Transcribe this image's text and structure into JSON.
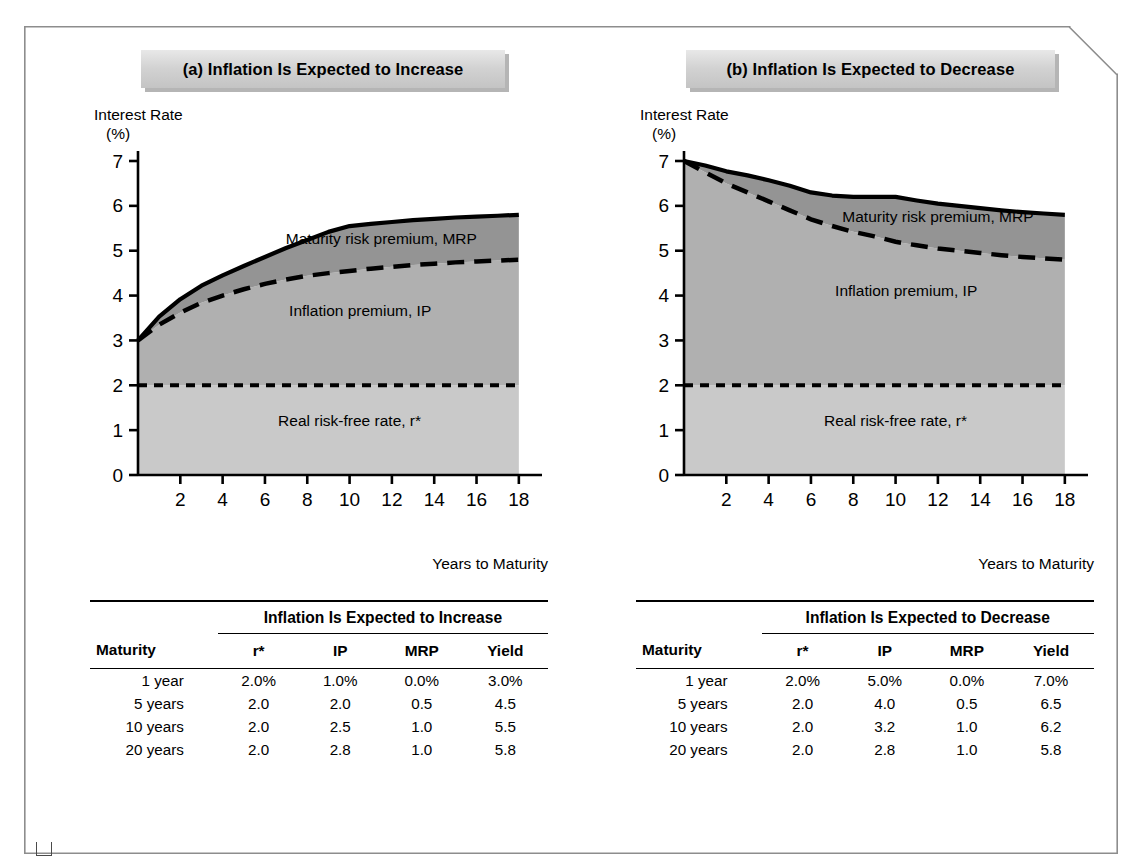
{
  "panels": [
    {
      "id": "a",
      "title": "(a) Inflation Is Expected to Increase",
      "y_axis_label": "Interest Rate",
      "y_axis_unit": "(%)",
      "x_axis_label": "Years to Maturity",
      "band_labels": {
        "mrp": "Maturity risk premium, MRP",
        "ip": "Inflation premium, IP",
        "rf": "Real risk-free rate, r*"
      },
      "table": {
        "group_header": "Inflation Is Expected to Increase",
        "columns": [
          "Maturity",
          "r*",
          "IP",
          "MRP",
          "Yield"
        ],
        "rows": [
          [
            "1 year",
            "2.0%",
            "1.0%",
            "0.0%",
            "3.0%"
          ],
          [
            "5 years",
            "2.0",
            "2.0",
            "0.5",
            "4.5"
          ],
          [
            "10 years",
            "2.0",
            "2.5",
            "1.0",
            "5.5"
          ],
          [
            "20 years",
            "2.0",
            "2.8",
            "1.0",
            "5.8"
          ]
        ]
      }
    },
    {
      "id": "b",
      "title": "(b) Inflation Is Expected to Decrease",
      "y_axis_label": "Interest Rate",
      "y_axis_unit": "(%)",
      "x_axis_label": "Years to Maturity",
      "band_labels": {
        "mrp": "Maturity risk premium, MRP",
        "ip": "Inflation premium, IP",
        "rf": "Real risk-free rate, r*"
      },
      "table": {
        "group_header": "Inflation Is Expected to Decrease",
        "columns": [
          "Maturity",
          "r*",
          "IP",
          "MRP",
          "Yield"
        ],
        "rows": [
          [
            "1 year",
            "2.0%",
            "5.0%",
            "0.0%",
            "7.0%"
          ],
          [
            "5 years",
            "2.0",
            "4.0",
            "0.5",
            "6.5"
          ],
          [
            "10 years",
            "2.0",
            "3.2",
            "1.0",
            "6.2"
          ],
          [
            "20 years",
            "2.0",
            "2.8",
            "1.0",
            "5.8"
          ]
        ]
      }
    }
  ],
  "colors": {
    "band_riskfree": "#c9c9c9",
    "band_inflation": "#b0b0b0",
    "band_mrp": "#949494",
    "axis": "#000000",
    "frame_border": "#8d8d8d",
    "title_box": "#d2d2d2"
  },
  "chart_data": [
    {
      "type": "area",
      "title": "(a) Inflation Is Expected to Increase",
      "xlabel": "Years to Maturity",
      "ylabel": "Interest Rate (%)",
      "xlim": [
        0,
        19
      ],
      "ylim": [
        0,
        7
      ],
      "xticks": [
        2,
        4,
        6,
        8,
        10,
        12,
        14,
        16,
        18
      ],
      "yticks": [
        0,
        1,
        2,
        3,
        4,
        5,
        6,
        7
      ],
      "grid": false,
      "stacked": true,
      "x": [
        0,
        1,
        2,
        3,
        4,
        5,
        6,
        7,
        8,
        9,
        10,
        11,
        12,
        13,
        14,
        15,
        16,
        17,
        18
      ],
      "series": [
        {
          "name": "Real risk-free rate, r*",
          "values": [
            2.0,
            2.0,
            2.0,
            2.0,
            2.0,
            2.0,
            2.0,
            2.0,
            2.0,
            2.0,
            2.0,
            2.0,
            2.0,
            2.0,
            2.0,
            2.0,
            2.0,
            2.0,
            2.0
          ]
        },
        {
          "name": "Inflation premium, IP",
          "values": [
            1.0,
            1.35,
            1.62,
            1.84,
            2.0,
            2.14,
            2.26,
            2.36,
            2.44,
            2.5,
            2.55,
            2.6,
            2.64,
            2.68,
            2.71,
            2.74,
            2.76,
            2.78,
            2.8
          ]
        },
        {
          "name": "Maturity risk premium, MRP",
          "values": [
            0.0,
            0.18,
            0.3,
            0.38,
            0.45,
            0.52,
            0.6,
            0.7,
            0.8,
            0.92,
            1.0,
            1.0,
            1.0,
            1.0,
            1.0,
            1.0,
            1.0,
            1.0,
            1.0
          ]
        }
      ],
      "yield_curve": {
        "name": "Yield",
        "values": [
          3.0,
          3.53,
          3.92,
          4.22,
          4.45,
          4.66,
          4.86,
          5.06,
          5.24,
          5.42,
          5.55,
          5.6,
          5.64,
          5.68,
          5.71,
          5.74,
          5.76,
          5.78,
          5.8
        ]
      },
      "annotations": [
        {
          "text": "Maturity risk premium, MRP",
          "x": 11.5,
          "y": 5.15
        },
        {
          "text": "Inflation premium, IP",
          "x": 10.5,
          "y": 3.55
        },
        {
          "text": "Real risk-free rate, r*",
          "x": 10.0,
          "y": 1.1
        }
      ]
    },
    {
      "type": "area",
      "title": "(b) Inflation Is Expected to Decrease",
      "xlabel": "Years to Maturity",
      "ylabel": "Interest Rate (%)",
      "xlim": [
        0,
        19
      ],
      "ylim": [
        0,
        7
      ],
      "xticks": [
        2,
        4,
        6,
        8,
        10,
        12,
        14,
        16,
        18
      ],
      "yticks": [
        0,
        1,
        2,
        3,
        4,
        5,
        6,
        7
      ],
      "grid": false,
      "stacked": true,
      "x": [
        0,
        1,
        2,
        3,
        4,
        5,
        6,
        7,
        8,
        9,
        10,
        11,
        12,
        13,
        14,
        15,
        16,
        17,
        18
      ],
      "series": [
        {
          "name": "Real risk-free rate, r*",
          "values": [
            2.0,
            2.0,
            2.0,
            2.0,
            2.0,
            2.0,
            2.0,
            2.0,
            2.0,
            2.0,
            2.0,
            2.0,
            2.0,
            2.0,
            2.0,
            2.0,
            2.0,
            2.0,
            2.0
          ]
        },
        {
          "name": "Inflation premium, IP",
          "values": [
            5.0,
            4.75,
            4.5,
            4.3,
            4.1,
            3.9,
            3.7,
            3.55,
            3.42,
            3.32,
            3.2,
            3.12,
            3.05,
            3.0,
            2.95,
            2.9,
            2.86,
            2.83,
            2.8
          ]
        },
        {
          "name": "Maturity risk premium, MRP",
          "values": [
            0.0,
            0.15,
            0.27,
            0.38,
            0.47,
            0.55,
            0.6,
            0.68,
            0.78,
            0.88,
            1.0,
            1.0,
            1.0,
            1.0,
            1.0,
            1.0,
            1.0,
            1.0,
            1.0
          ]
        }
      ],
      "yield_curve": {
        "name": "Yield",
        "values": [
          7.0,
          6.9,
          6.77,
          6.68,
          6.57,
          6.45,
          6.3,
          6.23,
          6.2,
          6.2,
          6.2,
          6.12,
          6.05,
          6.0,
          5.95,
          5.9,
          5.86,
          5.83,
          5.8
        ]
      },
      "annotations": [
        {
          "text": "Maturity risk premium, MRP",
          "x": 12.0,
          "y": 5.65
        },
        {
          "text": "Inflation premium, IP",
          "x": 10.5,
          "y": 4.0
        },
        {
          "text": "Real risk-free rate, r*",
          "x": 10.0,
          "y": 1.1
        }
      ]
    }
  ]
}
